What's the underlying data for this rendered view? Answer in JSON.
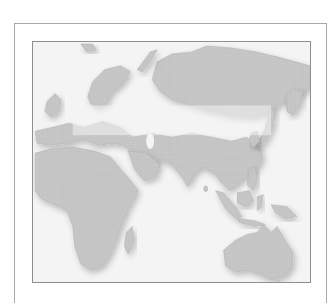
{
  "map": {
    "type": "world-region",
    "regions_shown": [
      "Europe",
      "Asia",
      "Africa",
      "Australia"
    ],
    "colors": {
      "land": "#c6c6c6",
      "land_edge": "#b3b3b3",
      "ocean": "#f4f4f4",
      "frame": "#8f8f8f",
      "outer_frame": "#a8a8a8"
    }
  }
}
